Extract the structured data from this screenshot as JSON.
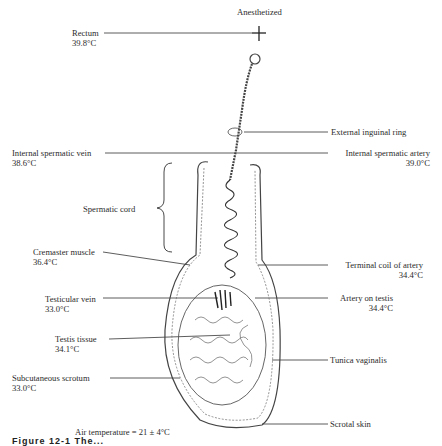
{
  "figure": {
    "condition": "Anesthetized",
    "air_temperature": "Air temperature = 21 ± 4°C",
    "caption_fragment": "Figure 12-1  The..."
  },
  "labels": {
    "rectum": {
      "name": "Rectum",
      "temp": "39.8°C"
    },
    "internal_spermatic_vein": {
      "name": "Internal spermatic vein",
      "temp": "38.6°C"
    },
    "spermatic_cord": {
      "name": "Spermatic cord"
    },
    "cremaster_muscle": {
      "name": "Cremaster muscle",
      "temp": "36.4°C"
    },
    "testicular_vein": {
      "name": "Testicular vein",
      "temp": "33.0°C"
    },
    "testis_tissue": {
      "name": "Testis tissue",
      "temp": "34.1°C"
    },
    "subcutaneous_scrotum": {
      "name": "Subcutaneous scrotum",
      "temp": "33.0°C"
    },
    "external_inguinal_ring": {
      "name": "External inguinal ring"
    },
    "internal_spermatic_artery": {
      "name": "Internal spermatic artery",
      "temp": "39.0°C"
    },
    "terminal_coil_of_artery": {
      "name": "Terminal coil of artery",
      "temp": "34.4°C"
    },
    "artery_on_testis": {
      "name": "Artery on testis",
      "temp": "34.4°C"
    },
    "tunica_vaginalis": {
      "name": "Tunica vaginalis"
    },
    "scrotal_skin": {
      "name": "Scrotal skin"
    }
  }
}
